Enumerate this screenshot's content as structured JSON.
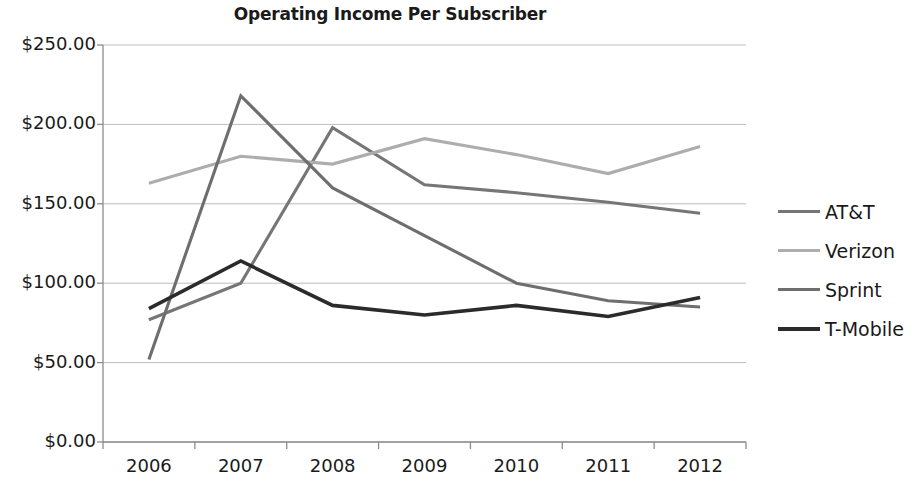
{
  "chart_data": {
    "type": "line",
    "title": "Operating Income Per Subscriber",
    "xlabel": "",
    "ylabel": "",
    "categories": [
      "2006",
      "2007",
      "2008",
      "2009",
      "2010",
      "2011",
      "2012"
    ],
    "ylim": [
      0,
      250
    ],
    "ytick_values": [
      0,
      50,
      100,
      150,
      200,
      250
    ],
    "ytick_labels": [
      "$0.00",
      "$50.00",
      "$100.00",
      "$150.00",
      "$200.00",
      "$250.00"
    ],
    "grid": true,
    "legend_position": "right",
    "series": [
      {
        "name": "AT&T",
        "color": "#767676",
        "values": [
          77,
          100,
          198,
          162,
          157,
          151,
          144
        ]
      },
      {
        "name": "Verizon",
        "color": "#adadad",
        "values": [
          163,
          180,
          175,
          191,
          181,
          169,
          186
        ]
      },
      {
        "name": "Sprint",
        "color": "#6e6e6e",
        "values": [
          52,
          218,
          160,
          130,
          100,
          89,
          85
        ]
      },
      {
        "name": "T-Mobile",
        "color": "#2b2b2b",
        "values": [
          84,
          114,
          86,
          80,
          86,
          79,
          91
        ]
      }
    ]
  },
  "axes": {
    "axis_color": "#8c8c8c",
    "grid_color": "#bdbdbd"
  }
}
